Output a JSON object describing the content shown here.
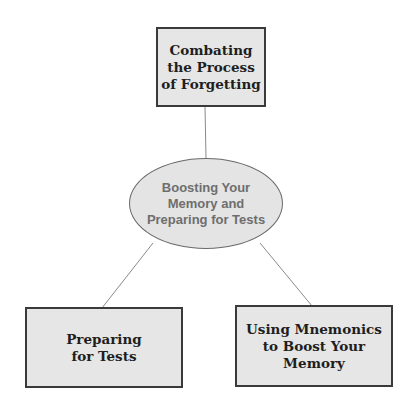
{
  "diagram": {
    "type": "concept-map",
    "center": {
      "label": "Boosting Your\nMemory and\nPreparing for Tests"
    },
    "nodes": [
      {
        "id": "top",
        "label": "Combating\nthe Process\nof Forgetting"
      },
      {
        "id": "bottom-left",
        "label": "Preparing\nfor Tests"
      },
      {
        "id": "bottom-right",
        "label": "Using Mnemonics\nto Boost Your\nMemory"
      }
    ],
    "edges": [
      {
        "from": "center",
        "to": "top"
      },
      {
        "from": "center",
        "to": "bottom-left"
      },
      {
        "from": "center",
        "to": "bottom-right"
      }
    ],
    "colors": {
      "box_fill": "#e6e6e6",
      "box_border": "#3a3a3a",
      "ellipse_fill": "#e4e4e4",
      "ellipse_text": "#6e6e6e",
      "connector": "#8a8a8a"
    }
  }
}
